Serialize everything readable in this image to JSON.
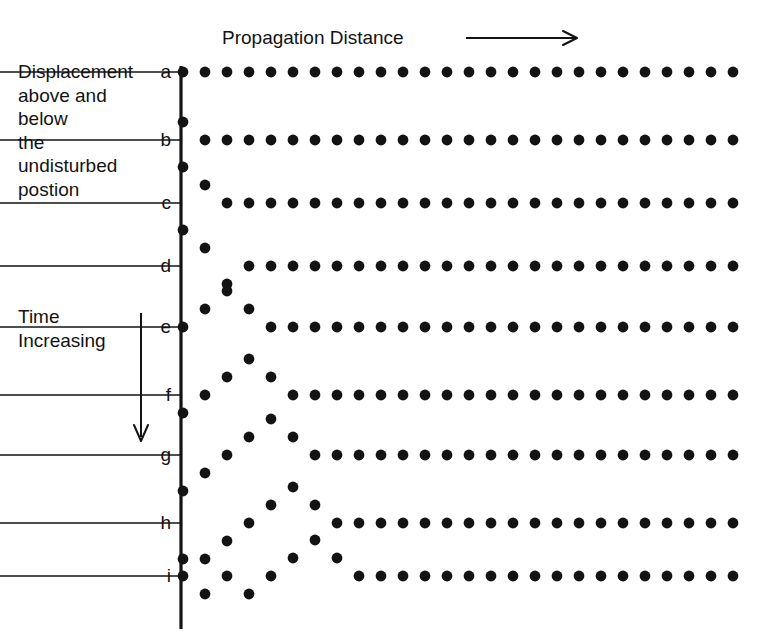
{
  "figure": {
    "title": "Propagation Distance",
    "y_caption": "Displacement above and\nbelow\nthe\nundisturbed\npostion",
    "time_caption": "Time\nIncreasing",
    "ink_color": "#131313",
    "background_color": "#ffffff"
  },
  "chart_data": {
    "type": "scatter",
    "title": "Propagation Distance",
    "xlabel": "Propagation Distance",
    "ylabel": "Displacement above and below the undisturbed postion",
    "annotations": [
      {
        "text": "Propagation Distance",
        "arrow": "right",
        "position": "top"
      },
      {
        "text": "Time Increasing",
        "arrow": "down",
        "position": "left"
      }
    ],
    "grid": false,
    "legend": null,
    "row_labels": [
      "a",
      "b",
      "c",
      "d",
      "e",
      "f",
      "g",
      "h",
      "i"
    ],
    "particle_count": 26,
    "x_spacing_px": 22,
    "amplitude_unit_px": 18,
    "series": [
      {
        "name": "a",
        "baseline_y": 72,
        "displacements": [
          0,
          0,
          0,
          0,
          0,
          0,
          0,
          0,
          0,
          0,
          0,
          0,
          0,
          0,
          0,
          0,
          0,
          0,
          0,
          0,
          0,
          0,
          0,
          0,
          0,
          0
        ]
      },
      {
        "name": "b",
        "baseline_y": 140,
        "displacements": [
          1,
          0,
          0,
          0,
          0,
          0,
          0,
          0,
          0,
          0,
          0,
          0,
          0,
          0,
          0,
          0,
          0,
          0,
          0,
          0,
          0,
          0,
          0,
          0,
          0,
          0
        ]
      },
      {
        "name": "c",
        "baseline_y": 203,
        "displacements": [
          2,
          1,
          0,
          0,
          0,
          0,
          0,
          0,
          0,
          0,
          0,
          0,
          0,
          0,
          0,
          0,
          0,
          0,
          0,
          0,
          0,
          0,
          0,
          0,
          0,
          0
        ]
      },
      {
        "name": "d",
        "baseline_y": 266,
        "displacements": [
          2,
          1,
          -1,
          0,
          0,
          0,
          0,
          0,
          0,
          0,
          0,
          0,
          0,
          0,
          0,
          0,
          0,
          0,
          0,
          0,
          0,
          0,
          0,
          0,
          0,
          0
        ]
      },
      {
        "name": "e",
        "baseline_y": 327,
        "displacements": [
          0,
          1,
          2,
          1,
          0,
          0,
          0,
          0,
          0,
          0,
          0,
          0,
          0,
          0,
          0,
          0,
          0,
          0,
          0,
          0,
          0,
          0,
          0,
          0,
          0,
          0
        ]
      },
      {
        "name": "f",
        "baseline_y": 395,
        "displacements": [
          -1,
          0,
          1,
          2,
          1,
          0,
          0,
          0,
          0,
          0,
          0,
          0,
          0,
          0,
          0,
          0,
          0,
          0,
          0,
          0,
          0,
          0,
          0,
          0,
          0,
          0
        ]
      },
      {
        "name": "g",
        "baseline_y": 455,
        "displacements": [
          -2,
          -1,
          0,
          1,
          2,
          1,
          0,
          0,
          0,
          0,
          0,
          0,
          0,
          0,
          0,
          0,
          0,
          0,
          0,
          0,
          0,
          0,
          0,
          0,
          0,
          0
        ]
      },
      {
        "name": "h",
        "baseline_y": 523,
        "displacements": [
          -2,
          -2,
          -1,
          0,
          1,
          2,
          1,
          0,
          0,
          0,
          0,
          0,
          0,
          0,
          0,
          0,
          0,
          0,
          0,
          0,
          0,
          0,
          0,
          0,
          0,
          0
        ]
      },
      {
        "name": "i",
        "baseline_y": 576,
        "displacements": [
          0,
          -1,
          0,
          -1,
          0,
          1,
          2,
          1,
          0,
          0,
          0,
          0,
          0,
          0,
          0,
          0,
          0,
          0,
          0,
          0,
          0,
          0,
          0,
          0,
          0,
          0
        ]
      }
    ],
    "axis": {
      "x_origin_px": 181,
      "x_end_px": 749,
      "y_top_px": 66,
      "y_bottom_px": 629
    }
  }
}
